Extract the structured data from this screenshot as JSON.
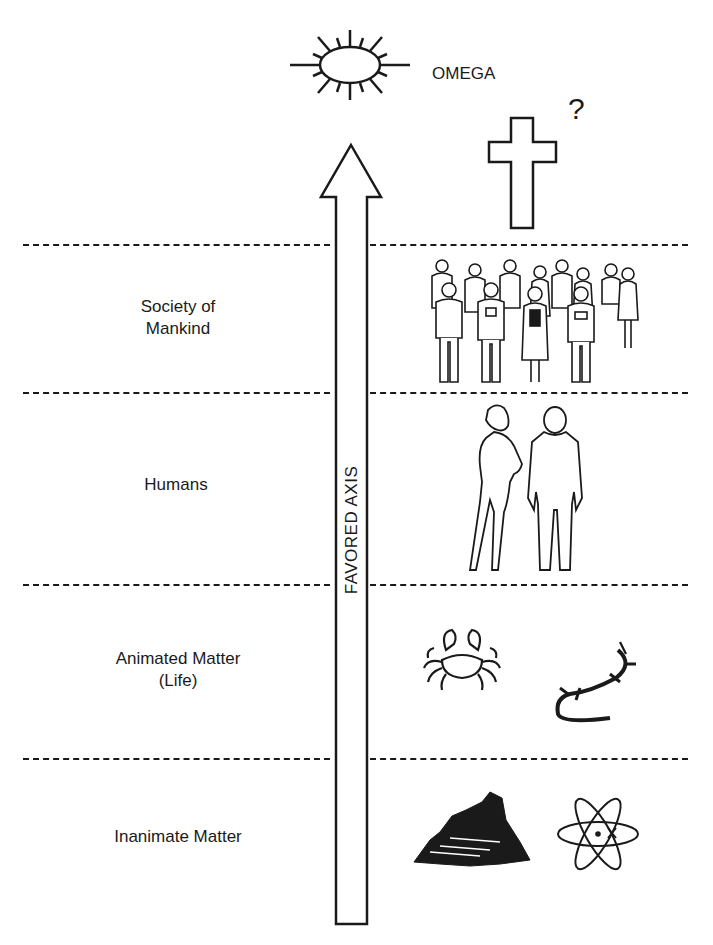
{
  "diagram": {
    "top_caption_cut_off": "",
    "apex": {
      "label": "OMEGA",
      "icon": "sun-oval-icon"
    },
    "speculation": {
      "icon": "cross-icon",
      "mark": "?"
    },
    "axis": {
      "label": "FAVORED AXIS",
      "direction": "up"
    },
    "levels": [
      {
        "id": "society",
        "label_line1": "Society of",
        "label_line2": "Mankind",
        "icon": "crowd-of-people-icon"
      },
      {
        "id": "humans",
        "label_line1": "Humans",
        "label_line2": "",
        "icon": "man-and-woman-icon"
      },
      {
        "id": "life",
        "label_line1": "Animated Matter",
        "label_line2": "(Life)",
        "icon": "crab-and-lizard-icon"
      },
      {
        "id": "inanimate",
        "label_line1": "Inanimate Matter",
        "label_line2": "",
        "icon": "rock-and-atom-icon"
      }
    ],
    "colors": {
      "ink": "#1a1a1a",
      "background": "#ffffff"
    }
  }
}
